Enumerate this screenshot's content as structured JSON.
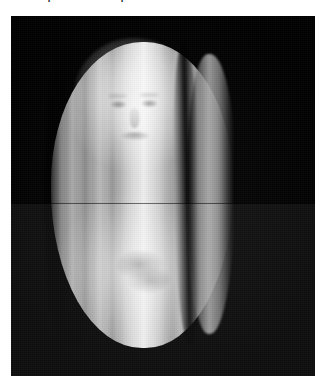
{
  "page": {
    "background_color": "#ffffff",
    "width": 326,
    "height": 386
  },
  "caption": {
    "text": "then as part of the final picture.",
    "note": "line is cropped by the top edge of the screenshot; only descenders are visible"
  },
  "figure": {
    "name": "photograph",
    "frame_color": "#000000",
    "alt": "Black-and-white photograph of a luminous veiled figure",
    "subject": {
      "description": "A tall oval shrouded/veiled form filling the frame, draped in vertical cloth folds, with a faint human face showing through the veil in the upper third",
      "face": {
        "visible": true,
        "features": [
          "eyes",
          "brows",
          "nose",
          "mouth"
        ],
        "region": "upper third of the figure"
      },
      "folds": {
        "orientation": "vertical",
        "count_visible": 7,
        "dark_crease": "a deep black vertical crease separates a narrow bright fold on the right side of the body"
      }
    },
    "artifacts": {
      "horizontal_seam": {
        "present": true,
        "position": "mid-height",
        "description": "brightness discontinuity; the lower half of the photograph is rendered slightly brighter than the upper half"
      },
      "grain": "visible film/scan grain across the whole frame"
    },
    "palette": {
      "background": "#000000",
      "highlight": "#efefef",
      "midtone": "#a9a9a9",
      "shadow": "#2a2a2a"
    }
  }
}
